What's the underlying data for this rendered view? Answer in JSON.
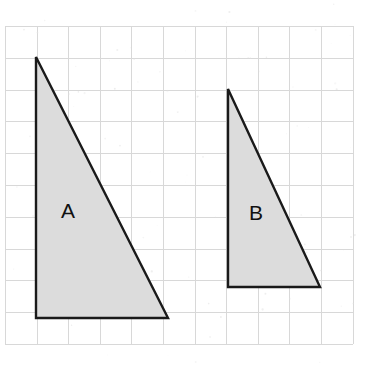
{
  "figure": {
    "background_color": "#ffffff",
    "canvas": {
      "width": 366,
      "height": 366
    }
  },
  "grid": {
    "line_color_major": "#d8d8d8",
    "line_color_minor": "#ededed",
    "origin_x": 5,
    "origin_y": 26,
    "cell_width": 31.6,
    "cell_height": 31.8,
    "columns": 11,
    "rows": 10,
    "visible": true
  },
  "shapes": [
    {
      "id": "triangle-a",
      "label": "A",
      "fill_color": "#dcdcdc",
      "stroke_color": "#1a1a1a",
      "stroke_width": 2.4,
      "kind": "right-triangle",
      "points": "36,57 36,318 168,318",
      "label_x": 68,
      "label_y": 212,
      "vertices": [
        {
          "name": "apex",
          "x": 36,
          "y": 57
        },
        {
          "name": "bottom-left",
          "x": 36,
          "y": 318
        },
        {
          "name": "bottom-right",
          "x": 168,
          "y": 318
        }
      ],
      "legs": {
        "vertical_px": 261,
        "horizontal_px": 132
      },
      "grid_units": {
        "height": 8.2,
        "base": 4.2
      }
    },
    {
      "id": "triangle-b",
      "label": "B",
      "fill_color": "#dcdcdc",
      "stroke_color": "#1a1a1a",
      "stroke_width": 2.4,
      "kind": "right-triangle",
      "points": "228,89 228,287 320,287",
      "label_x": 256,
      "label_y": 214,
      "vertices": [
        {
          "name": "apex",
          "x": 228,
          "y": 89
        },
        {
          "name": "bottom-left",
          "x": 228,
          "y": 287
        },
        {
          "name": "bottom-right",
          "x": 320,
          "y": 287
        }
      ],
      "legs": {
        "vertical_px": 198,
        "horizontal_px": 92
      },
      "grid_units": {
        "height": 6.2,
        "base": 2.9
      }
    }
  ],
  "labels": {
    "a": "A",
    "b": "B"
  }
}
